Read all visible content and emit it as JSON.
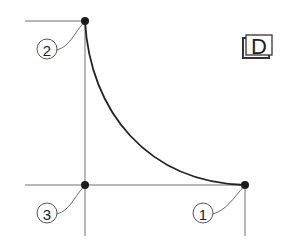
{
  "diagram": {
    "badge": {
      "label": "D"
    },
    "points": [
      {
        "id": "1",
        "label": "1",
        "x": 245,
        "y": 185,
        "label_x": 203,
        "label_y": 213
      },
      {
        "id": "2",
        "label": "2",
        "x": 85,
        "y": 21,
        "label_x": 47,
        "label_y": 49
      },
      {
        "id": "3",
        "label": "3",
        "x": 85,
        "y": 185,
        "label_x": 47,
        "label_y": 213
      }
    ],
    "curve": {
      "from": "2",
      "to": "1",
      "type": "concave-arc"
    },
    "colors": {
      "line": "#222222",
      "guide": "#6e6e6e",
      "background": "#ffffff"
    }
  }
}
